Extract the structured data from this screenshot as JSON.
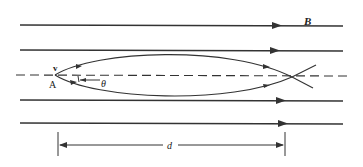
{
  "diagram": {
    "labels": {
      "field": "B",
      "velocity": "v",
      "point": "A",
      "angle": "θ",
      "distance": "d"
    },
    "colors": {
      "line": "#333333",
      "background": "#ffffff"
    },
    "field_lines": 4,
    "field_direction": "right"
  }
}
